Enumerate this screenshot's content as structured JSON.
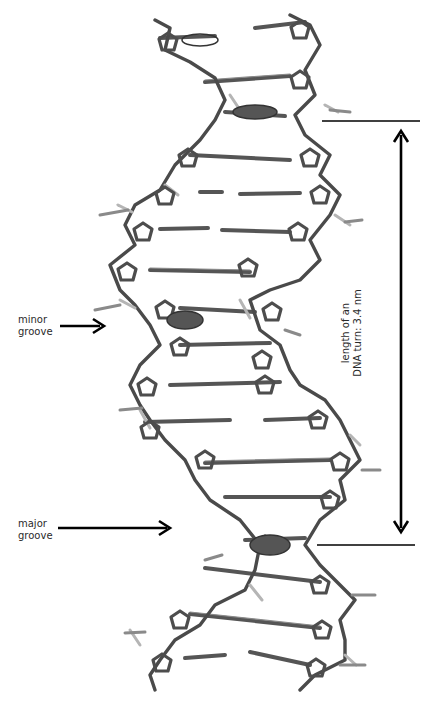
{
  "figure": {
    "annotations": {
      "minor_groove": {
        "line1": "minor",
        "line2": "groove"
      },
      "major_groove": {
        "line1": "major",
        "line2": "groove"
      },
      "turn_length": {
        "line1": "length of an",
        "line2": "DNA turn: 3.4 nm"
      }
    },
    "colors": {
      "background": "#ffffff",
      "backbone": "#4a4a4a",
      "backbone_light": "#9a9a9a",
      "phosphate": "#c8c8c8",
      "annotation": "#000000"
    }
  }
}
